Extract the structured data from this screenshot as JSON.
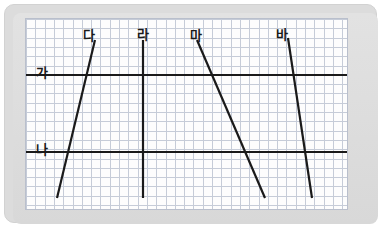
{
  "figure": {
    "background_color": "#dcdcdc",
    "paper_color": "#fdfdfd",
    "grid_color": "#c6ccd8",
    "line_color": "#1a1a1a",
    "grid_cell_px": 9.3
  },
  "axes": {
    "x_min_px": 25,
    "x_max_px": 348,
    "y_min_px": 18,
    "y_max_px": 210,
    "grid": true
  },
  "chart_data": {
    "type": "line",
    "xlabel": "",
    "ylabel": "",
    "grid": true,
    "legend": "none",
    "xlim": [
      25,
      348
    ],
    "ylim": [
      18,
      210
    ],
    "annotations": [
      {
        "id": "ga",
        "label": "가",
        "x": 36,
        "y": 66,
        "describes": "horizontal-line-ga"
      },
      {
        "id": "na",
        "label": "나",
        "x": 36,
        "y": 143,
        "describes": "horizontal-line-na"
      },
      {
        "id": "da",
        "label": "다",
        "x": 83,
        "y": 29,
        "describes": "diagonal-line-da"
      },
      {
        "id": "ra",
        "label": "라",
        "x": 137,
        "y": 28,
        "describes": "vertical-line-ra"
      },
      {
        "id": "ma",
        "label": "마",
        "x": 190,
        "y": 29,
        "describes": "diagonal-line-ma"
      },
      {
        "id": "ba",
        "label": "바",
        "x": 276,
        "y": 28,
        "describes": "diagonal-line-ba"
      }
    ],
    "series": [
      {
        "name": "가",
        "kind": "horizontal",
        "points": [
          {
            "x": 26,
            "y": 75
          },
          {
            "x": 347,
            "y": 75
          }
        ],
        "stroke_width": 2.2
      },
      {
        "name": "나",
        "kind": "horizontal",
        "points": [
          {
            "x": 26,
            "y": 152
          },
          {
            "x": 347,
            "y": 152
          }
        ],
        "stroke_width": 2.2
      },
      {
        "name": "다",
        "kind": "diagonal",
        "points": [
          {
            "x": 57,
            "y": 198
          },
          {
            "x": 95,
            "y": 40
          }
        ],
        "stroke_width": 2.2
      },
      {
        "name": "라",
        "kind": "vertical",
        "points": [
          {
            "x": 143,
            "y": 40
          },
          {
            "x": 143,
            "y": 198
          }
        ],
        "stroke_width": 2.2
      },
      {
        "name": "마",
        "kind": "diagonal",
        "points": [
          {
            "x": 197,
            "y": 40
          },
          {
            "x": 265,
            "y": 198
          }
        ],
        "stroke_width": 2.2
      },
      {
        "name": "바",
        "kind": "diagonal",
        "points": [
          {
            "x": 288,
            "y": 38
          },
          {
            "x": 312,
            "y": 198
          }
        ],
        "stroke_width": 2.2
      }
    ]
  }
}
